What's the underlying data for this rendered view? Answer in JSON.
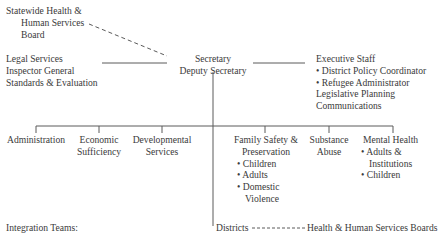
{
  "statewide_board": {
    "lines": [
      "Statewide Health &",
      "Human Services",
      "Board"
    ]
  },
  "left_staff": {
    "lines": [
      "Legal Services",
      "Inspector General",
      "Standards & Evaluation"
    ]
  },
  "secretary": {
    "lines": [
      "Secretary",
      "Deputy Secretary"
    ]
  },
  "executive_staff": {
    "title": "Executive Staff",
    "bullets": [
      "District Policy Coordinator",
      "Refugee Administrator"
    ],
    "extra": [
      "Legislative Planning",
      "Communications"
    ]
  },
  "divisions": [
    {
      "lines": [
        "Administration"
      ],
      "bullets": []
    },
    {
      "lines": [
        "Economic",
        "Sufficiency"
      ],
      "bullets": []
    },
    {
      "lines": [
        "Developmental",
        "Services"
      ],
      "bullets": []
    },
    {
      "lines": [
        "Family Safety &",
        "Preservation"
      ],
      "bullets": [
        "Children",
        "Adults",
        "Domestic",
        "Violence"
      ]
    },
    {
      "lines": [
        "Substance",
        "Abuse"
      ],
      "bullets": []
    },
    {
      "lines": [
        "Mental Health"
      ],
      "bullets": [
        "Adults &",
        "Institutions",
        "Children"
      ]
    }
  ],
  "bottom": {
    "integration_teams": "Integration Teams:",
    "districts": "Districts",
    "hhs_boards": "Health & Human Services Boards"
  }
}
